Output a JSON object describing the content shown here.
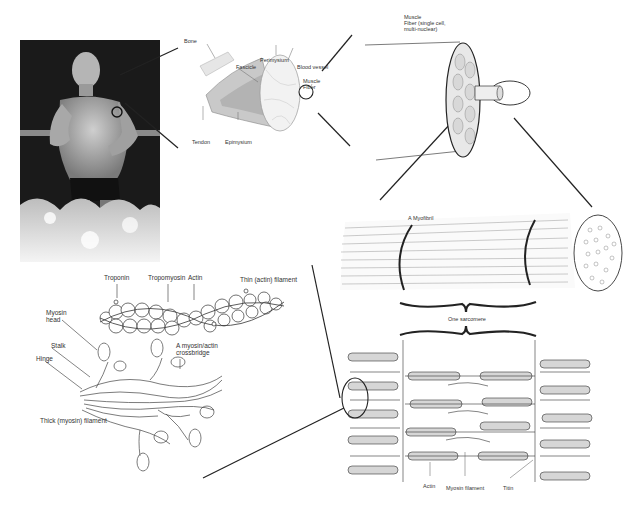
{
  "figure": {
    "panels": {
      "photo": {
        "description": "Photograph of a shirtless man running through water",
        "highlight": "circle on upper arm"
      },
      "whole_muscle": {
        "labels": {
          "bone": "Bone",
          "fascicle": "Fascicle",
          "perimysium": "Perimysium",
          "blood_vessel": "Blood vessel",
          "muscle_fiber": "Muscle\nFiber",
          "tendon": "Tendon",
          "epimysium": "Epimysium"
        }
      },
      "fiber": {
        "labels": {
          "title": "Muscle\nFiber (single cell,\nmulti-nuclear)"
        }
      },
      "myofibril": {
        "labels": {
          "title": "A Myofibril",
          "sarcomere": "One sarcomere"
        }
      },
      "sarcomere": {
        "labels": {
          "actin": "Actin",
          "myosin_filament": "Myosin filament",
          "titin": "Titin"
        }
      },
      "filaments": {
        "labels": {
          "troponin": "Troponin",
          "tropomyosin": "Tropomyosin",
          "actin": "Actin",
          "thin_filament": "Thin (actin) filament",
          "myosin_head": "Myosin\nhead",
          "stalk": "Stalk",
          "hinge": "Hinge",
          "crossbridge": "A myosin/actin\ncrossbridge",
          "thick_filament": "Thick (myosin) filament"
        }
      }
    },
    "colors": {
      "line": "#222222",
      "text": "#333333",
      "background": "#ffffff",
      "photo_dark": "#1b1b1b"
    }
  }
}
